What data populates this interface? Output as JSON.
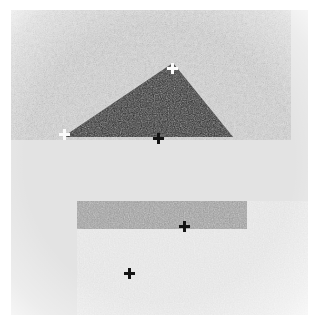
{
  "scene": {
    "title": "Noisy grayscale scene with geometric shapes",
    "width": 319,
    "height": 325,
    "paper_color": "#ffffff",
    "image_area": {
      "left": 11,
      "top": 10,
      "width": 297,
      "height": 305,
      "background_color": "#e3e3e3",
      "description": "grainy light-gray textured background"
    }
  },
  "shapes": [
    {
      "id": "triangle",
      "name": "dark-triangle",
      "type": "polygon",
      "fill_color": "#2b2b2b",
      "description": "solid dark scalene triangle, flat horizontal base",
      "vertices": [
        {
          "label": "apex",
          "x": 173,
          "y": 63
        },
        {
          "label": "left-base",
          "x": 63,
          "y": 137
        },
        {
          "label": "right-base",
          "x": 233,
          "y": 137
        }
      ]
    },
    {
      "id": "bar",
      "name": "gray-bar",
      "type": "rectangle",
      "fill_color": "#9a9a9a",
      "description": "horizontal mid-gray rectangular bar",
      "x": 77,
      "y": 201,
      "width": 170,
      "height": 28
    }
  ],
  "markers": [
    {
      "id": "m1",
      "name": "triangle-apex-marker",
      "glyph": "+",
      "color": "#fbfbfb",
      "polarity": "white",
      "x": 172,
      "y": 68
    },
    {
      "id": "m2",
      "name": "triangle-left-vertex-marker",
      "glyph": "+",
      "color": "#fbfbfb",
      "polarity": "white",
      "x": 64,
      "y": 134
    },
    {
      "id": "m3",
      "name": "triangle-base-edge-marker",
      "glyph": "+",
      "color": "#141414",
      "polarity": "black",
      "x": 158,
      "y": 138
    },
    {
      "id": "m4",
      "name": "bar-bottom-edge-marker",
      "glyph": "+",
      "color": "#141414",
      "polarity": "black",
      "x": 184,
      "y": 226
    },
    {
      "id": "m5",
      "name": "background-point-marker",
      "glyph": "+",
      "color": "#141414",
      "polarity": "black",
      "x": 129,
      "y": 273
    }
  ],
  "palette": {
    "paper": "#ffffff",
    "background": "#e3e3e3",
    "triangle": "#2b2b2b",
    "bar": "#9a9a9a",
    "marker_white": "#fbfbfb",
    "marker_black": "#141414"
  }
}
